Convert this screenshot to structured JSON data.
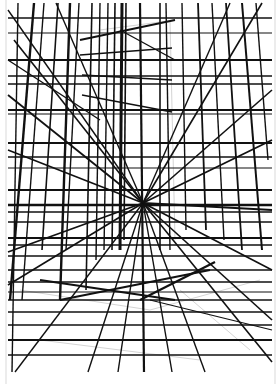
{
  "artwork": {
    "subject": "perspective line drawing of a tall building over a ground grid",
    "background": "#ffffff",
    "paper_edge_color": "#ececec",
    "ink_color": "#111111",
    "sketch_color": "#d4d4d4",
    "vanishing_point": [
      143,
      203
    ],
    "drawing_bounds": {
      "left": 8,
      "top": 3,
      "right": 272,
      "bottom": 372
    },
    "horizontal_lines": [
      {
        "y": 18,
        "w": 1.6
      },
      {
        "y": 33,
        "w": 1.2
      },
      {
        "y": 60,
        "w": 2.0
      },
      {
        "y": 76,
        "w": 1.4
      },
      {
        "y": 84,
        "w": 1.6
      },
      {
        "y": 110,
        "w": 2.2
      },
      {
        "y": 114,
        "w": 1.2
      },
      {
        "y": 143,
        "w": 2.2
      },
      {
        "y": 157,
        "w": 1.4
      },
      {
        "y": 168,
        "w": 1.2
      },
      {
        "y": 190,
        "w": 1.8
      },
      {
        "y": 205,
        "w": 2.6
      },
      {
        "y": 212,
        "w": 1.6
      },
      {
        "y": 222,
        "w": 1.4
      },
      {
        "y": 238,
        "w": 1.8
      },
      {
        "y": 245,
        "w": 1.4
      },
      {
        "y": 256,
        "w": 1.4
      },
      {
        "y": 270,
        "w": 1.6
      },
      {
        "y": 282,
        "w": 1.4
      },
      {
        "y": 292,
        "w": 1.2
      },
      {
        "y": 300,
        "w": 1.4
      },
      {
        "y": 312,
        "w": 1.6
      },
      {
        "y": 325,
        "w": 1.6
      },
      {
        "y": 340,
        "w": 1.8
      },
      {
        "y": 355,
        "w": 1.6
      }
    ],
    "vertical_lines": [
      {
        "x1": 18,
        "y1": 3,
        "x2": 12,
        "y2": 372,
        "w": 1.4
      },
      {
        "x1": 34,
        "y1": 3,
        "x2": 10,
        "y2": 300,
        "w": 2.4
      },
      {
        "x1": 44,
        "y1": 3,
        "x2": 22,
        "y2": 300,
        "w": 1.4
      },
      {
        "x1": 58,
        "y1": 3,
        "x2": 42,
        "y2": 250,
        "w": 1.6
      },
      {
        "x1": 70,
        "y1": 3,
        "x2": 60,
        "y2": 300,
        "w": 2.4
      },
      {
        "x1": 79,
        "y1": 3,
        "x2": 66,
        "y2": 250,
        "w": 1.4
      },
      {
        "x1": 92,
        "y1": 3,
        "x2": 86,
        "y2": 290,
        "w": 1.6
      },
      {
        "x1": 100,
        "y1": 3,
        "x2": 96,
        "y2": 260,
        "w": 1.4
      },
      {
        "x1": 108,
        "y1": 3,
        "x2": 104,
        "y2": 250,
        "w": 1.4
      },
      {
        "x1": 115,
        "y1": 3,
        "x2": 112,
        "y2": 250,
        "w": 1.6
      },
      {
        "x1": 122,
        "y1": 3,
        "x2": 120,
        "y2": 250,
        "w": 3.0
      },
      {
        "x1": 126,
        "y1": 3,
        "x2": 124,
        "y2": 240,
        "w": 1.6
      },
      {
        "x1": 140,
        "y1": 3,
        "x2": 144,
        "y2": 372,
        "w": 2.2
      },
      {
        "x1": 160,
        "y1": 3,
        "x2": 160,
        "y2": 250,
        "w": 1.6
      },
      {
        "x1": 166,
        "y1": 3,
        "x2": 170,
        "y2": 250,
        "w": 1.4
      },
      {
        "x1": 182,
        "y1": 3,
        "x2": 186,
        "y2": 230,
        "w": 1.4
      },
      {
        "x1": 198,
        "y1": 3,
        "x2": 206,
        "y2": 230,
        "w": 1.8
      },
      {
        "x1": 212,
        "y1": 3,
        "x2": 224,
        "y2": 240,
        "w": 1.4
      },
      {
        "x1": 226,
        "y1": 3,
        "x2": 242,
        "y2": 250,
        "w": 1.8
      },
      {
        "x1": 242,
        "y1": 3,
        "x2": 262,
        "y2": 250,
        "w": 2.0
      },
      {
        "x1": 256,
        "y1": 3,
        "x2": 268,
        "y2": 160,
        "w": 1.4
      }
    ],
    "diagonal_lines": [
      {
        "x1": 8,
        "y1": 10,
        "x2": 143,
        "y2": 203,
        "w": 1.4
      },
      {
        "x1": 14,
        "y1": 40,
        "x2": 143,
        "y2": 203,
        "w": 1.6
      },
      {
        "x1": 8,
        "y1": 95,
        "x2": 143,
        "y2": 203,
        "w": 1.8
      },
      {
        "x1": 8,
        "y1": 150,
        "x2": 143,
        "y2": 203,
        "w": 1.6
      },
      {
        "x1": 8,
        "y1": 252,
        "x2": 143,
        "y2": 203,
        "w": 1.8
      },
      {
        "x1": 8,
        "y1": 285,
        "x2": 143,
        "y2": 203,
        "w": 1.6
      },
      {
        "x1": 15,
        "y1": 372,
        "x2": 143,
        "y2": 203,
        "w": 1.4
      },
      {
        "x1": 88,
        "y1": 372,
        "x2": 143,
        "y2": 203,
        "w": 1.4
      },
      {
        "x1": 118,
        "y1": 372,
        "x2": 143,
        "y2": 203,
        "w": 1.4
      },
      {
        "x1": 172,
        "y1": 372,
        "x2": 143,
        "y2": 203,
        "w": 1.4
      },
      {
        "x1": 205,
        "y1": 372,
        "x2": 143,
        "y2": 203,
        "w": 1.4
      },
      {
        "x1": 272,
        "y1": 362,
        "x2": 143,
        "y2": 203,
        "w": 1.6
      },
      {
        "x1": 272,
        "y1": 320,
        "x2": 143,
        "y2": 203,
        "w": 1.6
      },
      {
        "x1": 272,
        "y1": 270,
        "x2": 143,
        "y2": 203,
        "w": 1.6
      },
      {
        "x1": 272,
        "y1": 210,
        "x2": 143,
        "y2": 203,
        "w": 1.8
      },
      {
        "x1": 272,
        "y1": 140,
        "x2": 143,
        "y2": 203,
        "w": 1.8
      },
      {
        "x1": 272,
        "y1": 90,
        "x2": 143,
        "y2": 203,
        "w": 1.6
      },
      {
        "x1": 262,
        "y1": 3,
        "x2": 143,
        "y2": 203,
        "w": 1.6
      },
      {
        "x1": 230,
        "y1": 3,
        "x2": 143,
        "y2": 203,
        "w": 1.4
      },
      {
        "x1": 56,
        "y1": 3,
        "x2": 143,
        "y2": 203,
        "w": 1.4
      },
      {
        "x1": 8,
        "y1": 60,
        "x2": 100,
        "y2": 120,
        "w": 1.4
      },
      {
        "x1": 80,
        "y1": 40,
        "x2": 175,
        "y2": 20,
        "w": 1.8
      },
      {
        "x1": 80,
        "y1": 55,
        "x2": 172,
        "y2": 48,
        "w": 1.4
      },
      {
        "x1": 82,
        "y1": 75,
        "x2": 172,
        "y2": 80,
        "w": 1.4
      },
      {
        "x1": 82,
        "y1": 95,
        "x2": 172,
        "y2": 112,
        "w": 1.4
      },
      {
        "x1": 120,
        "y1": 30,
        "x2": 175,
        "y2": 60,
        "w": 1.4
      },
      {
        "x1": 40,
        "y1": 280,
        "x2": 175,
        "y2": 300,
        "w": 2.2
      },
      {
        "x1": 60,
        "y1": 300,
        "x2": 210,
        "y2": 270,
        "w": 2.0
      },
      {
        "x1": 140,
        "y1": 300,
        "x2": 215,
        "y2": 262,
        "w": 2.2
      },
      {
        "x1": 150,
        "y1": 300,
        "x2": 272,
        "y2": 330,
        "w": 1.2
      }
    ],
    "sketch_lines": [
      {
        "x1": 100,
        "y1": 30,
        "x2": 175,
        "y2": 20
      },
      {
        "x1": 170,
        "y1": 20,
        "x2": 175,
        "y2": 240
      },
      {
        "x1": 100,
        "y1": 30,
        "x2": 96,
        "y2": 260
      },
      {
        "x1": 20,
        "y1": 290,
        "x2": 150,
        "y2": 310
      },
      {
        "x1": 150,
        "y1": 310,
        "x2": 260,
        "y2": 280
      },
      {
        "x1": 40,
        "y1": 340,
        "x2": 200,
        "y2": 360
      },
      {
        "x1": 180,
        "y1": 290,
        "x2": 250,
        "y2": 350
      }
    ]
  }
}
